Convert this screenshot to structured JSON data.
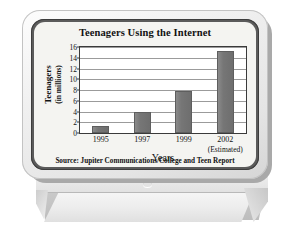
{
  "device": {
    "name": "computer-monitor-illustration",
    "power_button": "power-button-icon"
  },
  "chart_data": {
    "type": "bar",
    "title": "Teenagers Using the Internet",
    "xlabel": "Years",
    "ylabel": "Teenagers",
    "ylabel_line2": "(in millions)",
    "categories": [
      "1995",
      "1997",
      "1999",
      "2002"
    ],
    "category_notes": [
      "",
      "",
      "",
      "(Estimated)"
    ],
    "values": [
      1.3,
      4.0,
      7.8,
      15.3
    ],
    "ylim": [
      0,
      16
    ],
    "yticks": [
      0,
      2,
      4,
      6,
      8,
      10,
      12,
      14,
      16
    ],
    "grid": true,
    "legend": "none",
    "bar_color": "#767676",
    "source": "Source: Jupiter Communications/College and Teen Report"
  }
}
